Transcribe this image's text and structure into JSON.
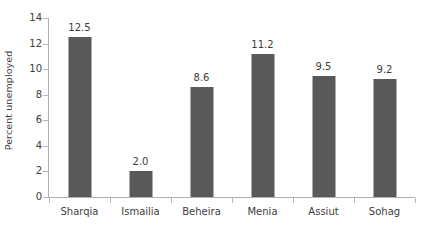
{
  "chart_data": {
    "type": "bar",
    "title": "",
    "subtitle": "",
    "xlabel": "",
    "ylabel": "Percent unemployed",
    "categories": [
      "Sharqia",
      "Ismailia",
      "Beheira",
      "Menia",
      "Assiut",
      "Sohag"
    ],
    "values": [
      12.5,
      2.0,
      8.6,
      11.2,
      9.5,
      9.2
    ],
    "value_labels": [
      "12.5",
      "2.0",
      "8.6",
      "11.2",
      "9.5",
      "9.2"
    ],
    "ylim": [
      0,
      14
    ],
    "ytick_values": [
      0,
      2,
      4,
      6,
      8,
      10,
      12,
      14
    ],
    "ytick_labels": [
      "0",
      "2",
      "4",
      "6",
      "8",
      "10",
      "12",
      "14"
    ],
    "grid": false,
    "legend": false,
    "legend_position": "none",
    "bar_color": "#595959",
    "axis_color": "#b0b0b0",
    "text_color": "#3d3d3d",
    "background_color": "#ffffff"
  }
}
